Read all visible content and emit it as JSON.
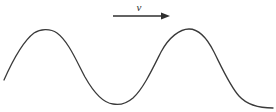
{
  "figure": {
    "width": 276,
    "height": 112,
    "background_color": "#ffffff",
    "stroke_color": "#3a3a3a",
    "stroke_width": 1.3
  },
  "annotation": {
    "velocity_label": "v",
    "velocity_label_x": 139,
    "velocity_label_y": 7,
    "arrow": {
      "name": "velocity-arrow",
      "direction": "right",
      "x_start": 113,
      "x_end": 170,
      "y": 16,
      "head_length": 9,
      "head_half_width": 3.4,
      "color": "#2f2f2f",
      "stroke_width": 1.3
    }
  },
  "chart_data": {
    "type": "line",
    "title": "",
    "xlabel": "",
    "ylabel": "",
    "xlim": [
      4,
      273
    ],
    "ylim": [
      104,
      30
    ],
    "grid": false,
    "legend": null,
    "annotations": [
      {
        "text": "v",
        "x": 139,
        "y": 7,
        "style": "italic",
        "meaning": "wave propagation speed"
      }
    ],
    "waveform": {
      "shape": "sinusoid",
      "midline_y": 67,
      "amplitude": 37,
      "wavelength": 151,
      "crest_x": [
        45,
        196
      ],
      "crest_y": 30,
      "trough_x": [
        122
      ],
      "trough_y": 104,
      "start_point": [
        4,
        80
      ],
      "end_point": [
        273,
        108
      ]
    },
    "path_d": "M 4,80 C 12,62 22,42 34,33 C 40,29 50,28 57,33 C 68,41 76,60 85,77 C 94,93 104,103 113,104 C 118,105 126,104 133,98 C 143,89 152,70 161,52 C 169,37 180,29 189,29 C 198,29 207,38 214,52 C 222,68 230,86 239,96 C 248,106 261,108 273,108"
  }
}
